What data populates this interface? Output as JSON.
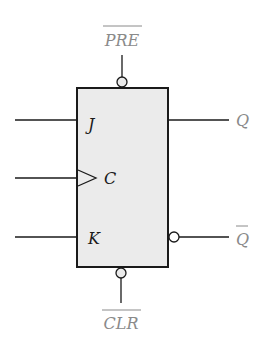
{
  "diagram": {
    "type": "JK flip-flop logic symbol",
    "colors": {
      "box_fill": "#ebebeb",
      "stroke": "#1a1a1a",
      "io_label": "#8a8a8a",
      "pin_label": "#1a1a1a"
    },
    "pins": {
      "preset": {
        "label": "PRE",
        "active_low": true
      },
      "j": {
        "label": "J"
      },
      "clock": {
        "label": "C",
        "edge_triggered": true
      },
      "k": {
        "label": "K"
      },
      "q": {
        "label": "Q"
      },
      "q_bar": {
        "label": "Q",
        "active_low": true
      },
      "clear": {
        "label": "CLR",
        "active_low": true
      }
    }
  }
}
